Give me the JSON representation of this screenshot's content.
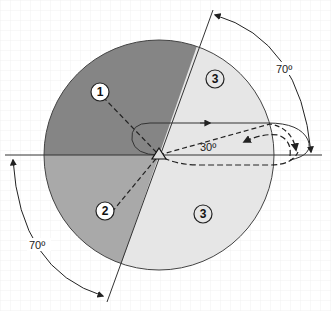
{
  "diagram": {
    "type": "field-of-view sector diagram",
    "colors": {
      "zone_1": "#858585",
      "zone_2": "#a9a9a9",
      "zone_3": "#e6e6e6",
      "line": "#333333",
      "grid": "#eeeeee"
    },
    "zones": [
      {
        "id": "zone-1",
        "label": "1"
      },
      {
        "id": "zone-2",
        "label": "2"
      },
      {
        "id": "zone-3-upper",
        "label": "3"
      },
      {
        "id": "zone-3-lower",
        "label": "3"
      }
    ],
    "angles": {
      "upper_right": "70º",
      "lower_left": "70º",
      "path": "30º"
    }
  }
}
